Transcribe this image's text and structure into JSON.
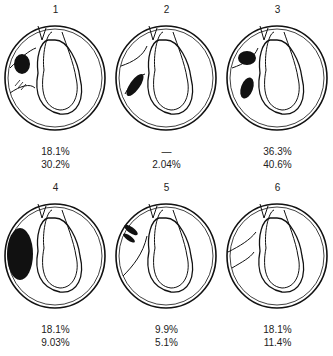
{
  "figure": {
    "panels": [
      {
        "id": "1",
        "value_a": "18.1%",
        "value_b": "30.2%"
      },
      {
        "id": "2",
        "value_a": "—",
        "value_b": "2.04%"
      },
      {
        "id": "3",
        "value_a": "36.3%",
        "value_b": "40.6%"
      },
      {
        "id": "4",
        "value_a": "18.1%",
        "value_b": "9.03%"
      },
      {
        "id": "5",
        "value_a": "9.9%",
        "value_b": "5.1%"
      },
      {
        "id": "6",
        "value_a": "18.1%",
        "value_b": "11.4%"
      }
    ]
  }
}
